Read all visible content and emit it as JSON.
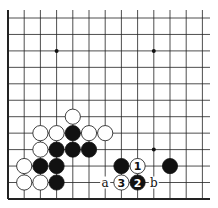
{
  "board": {
    "cols": 13,
    "rows": 12,
    "origin_x": 8,
    "origin_y": 18,
    "spacing_x": 16.2,
    "spacing_y": 16.45,
    "left_edge": true,
    "bottom_edge": true,
    "line_color": "#222222",
    "star_points": [
      [
        3,
        2
      ],
      [
        9,
        2
      ],
      [
        9,
        8
      ]
    ]
  },
  "stones": [
    {
      "color": "white",
      "col": 4,
      "row": 6
    },
    {
      "color": "white",
      "col": 2,
      "row": 7
    },
    {
      "color": "white",
      "col": 3,
      "row": 7
    },
    {
      "color": "black",
      "col": 4,
      "row": 7
    },
    {
      "color": "white",
      "col": 5,
      "row": 7
    },
    {
      "color": "white",
      "col": 6,
      "row": 7
    },
    {
      "color": "white",
      "col": 2,
      "row": 8
    },
    {
      "color": "black",
      "col": 3,
      "row": 8
    },
    {
      "color": "black",
      "col": 4,
      "row": 8
    },
    {
      "color": "black",
      "col": 5,
      "row": 8
    },
    {
      "color": "white",
      "col": 1,
      "row": 9
    },
    {
      "color": "black",
      "col": 2,
      "row": 9
    },
    {
      "color": "black",
      "col": 3,
      "row": 9
    },
    {
      "color": "black",
      "col": 7,
      "row": 9
    },
    {
      "color": "white",
      "col": 8,
      "row": 9,
      "label": "1"
    },
    {
      "color": "black",
      "col": 10,
      "row": 9
    },
    {
      "color": "white",
      "col": 1,
      "row": 10
    },
    {
      "color": "white",
      "col": 2,
      "row": 10
    },
    {
      "color": "black",
      "col": 3,
      "row": 10
    },
    {
      "color": "white",
      "col": 7,
      "row": 10,
      "label": "3"
    },
    {
      "color": "black",
      "col": 8,
      "row": 10,
      "label": "2"
    }
  ],
  "markers": [
    {
      "col": 6,
      "row": 10,
      "label": "a"
    },
    {
      "col": 9,
      "row": 10,
      "label": "b"
    }
  ]
}
